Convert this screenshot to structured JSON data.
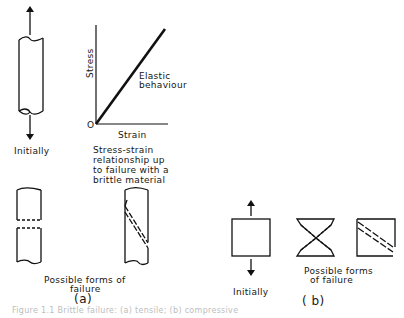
{
  "panel_a": {
    "initial_label": "Initially",
    "chart": {
      "y_label": "Stress",
      "x_label": "Strain",
      "origin_label": "O",
      "line_label_1": "Elastic",
      "line_label_2": "behaviour"
    },
    "chart_caption_1": "Stress-strain",
    "chart_caption_2": "relationship up",
    "chart_caption_3": "to failure with a",
    "chart_caption_4": "brittle material",
    "failure_label_1": "Possible  forms of",
    "failure_label_2": "failure",
    "panel_label": "(a)"
  },
  "panel_b": {
    "initial_label": "Initially",
    "failure_label_1": "Possible forms",
    "failure_label_2": "of failure",
    "panel_label": "( b)"
  },
  "caption": "Figure 1.1  Brittle failure: (a) tensile; (b) compressive"
}
